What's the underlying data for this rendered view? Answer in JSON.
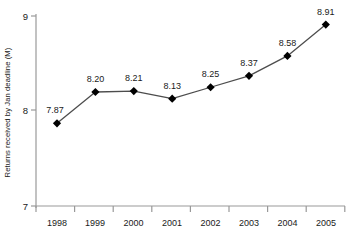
{
  "chart_data": {
    "type": "line",
    "title": "",
    "xlabel": "",
    "ylabel": "Returns received by Jan deadline (M)",
    "categories": [
      "1998",
      "1999",
      "2000",
      "2001",
      "2002",
      "2003",
      "2004",
      "2005"
    ],
    "values": [
      7.87,
      8.2,
      8.21,
      8.13,
      8.25,
      8.37,
      8.58,
      8.91
    ],
    "point_labels": [
      "7.87",
      "8.20",
      "8.21",
      "8.13",
      "8.25",
      "8.37",
      "8.58",
      "8.91"
    ],
    "ylim": [
      7,
      9
    ],
    "y_ticks": [
      7,
      8,
      9
    ],
    "y_tick_labels": [
      "7",
      "8",
      "9"
    ],
    "grid": false,
    "legend": "none",
    "marker": "diamond",
    "colors": {
      "line": "#4d4d4d",
      "marker": "#000000",
      "axis": "#999999",
      "text": "#1a1a1a",
      "background": "#ffffff"
    }
  }
}
